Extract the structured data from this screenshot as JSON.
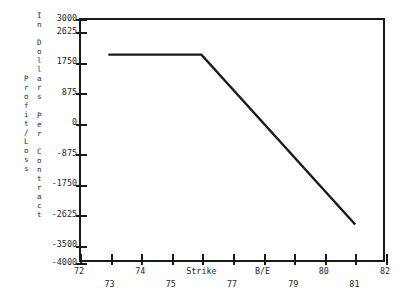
{
  "chart_data": {
    "type": "line",
    "title": "",
    "subtitle": "",
    "xlabel": "",
    "ylabel": "Profit/Loss",
    "ylabel_secondary": "In Dollars Per Contract",
    "xlim": [
      72,
      82
    ],
    "ylim": [
      -4000,
      3000
    ],
    "grid": false,
    "legend": null,
    "axis_color": "#1a1a1a",
    "line_color": "#1a1a1a",
    "background": "#ffffff",
    "y_ticks": [
      {
        "value": 3000,
        "label": "3000"
      },
      {
        "value": 2625,
        "label": "2625"
      },
      {
        "value": 1750,
        "label": "1750"
      },
      {
        "value": 875,
        "label": "875"
      },
      {
        "value": 0,
        "label": "0"
      },
      {
        "value": -875,
        "label": "-875"
      },
      {
        "value": -1750,
        "label": "-1750"
      },
      {
        "value": -2625,
        "label": "-2625"
      },
      {
        "value": -3500,
        "label": "-3500"
      },
      {
        "value": -4000,
        "label": "-4000"
      }
    ],
    "x_ticks": [
      {
        "value": 72,
        "label": "72",
        "row": "top"
      },
      {
        "value": 73,
        "label": "73",
        "row": "bot"
      },
      {
        "value": 74,
        "label": "74",
        "row": "top"
      },
      {
        "value": 75,
        "label": "75",
        "row": "bot"
      },
      {
        "value": 76,
        "label": "Strike",
        "row": "top"
      },
      {
        "value": 77,
        "label": "77",
        "row": "bot"
      },
      {
        "value": 78,
        "label": "B/E",
        "row": "top"
      },
      {
        "value": 79,
        "label": "79",
        "row": "bot"
      },
      {
        "value": 80,
        "label": "80",
        "row": "top"
      },
      {
        "value": 81,
        "label": "81",
        "row": "bot"
      },
      {
        "value": 82,
        "label": "82",
        "row": "top"
      }
    ],
    "series": [
      {
        "name": "Profit/Loss per Contract",
        "x": [
          73.0,
          76.0,
          81.0
        ],
        "y": [
          1950,
          1950,
          -2900
        ]
      }
    ],
    "annotations": [
      {
        "x": 76,
        "label": "Strike"
      },
      {
        "x": 78,
        "label": "B/E"
      }
    ]
  },
  "axis_titles": {
    "outer_chars": [
      "P",
      "r",
      "o",
      "f",
      "i",
      "t",
      "/",
      "L",
      "o",
      "s",
      "s"
    ],
    "inner_chars": [
      "I",
      "n",
      " ",
      "D",
      "o",
      "l",
      "l",
      "a",
      "r",
      "s",
      " ",
      "P",
      "e",
      "r",
      " ",
      "C",
      "o",
      "n",
      "t",
      "r",
      "a",
      "c",
      "t"
    ]
  }
}
